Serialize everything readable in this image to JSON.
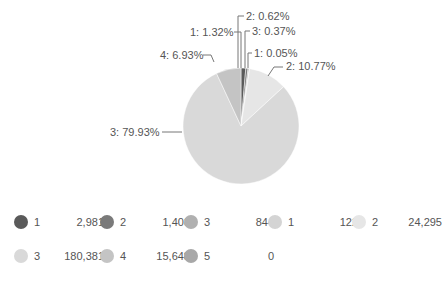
{
  "chart_data": {
    "type": "pie",
    "title": "",
    "start_angle": "12 o'clock, clockwise",
    "slices": [
      {
        "label": "1",
        "group": "A",
        "value": 2981,
        "percent": "1.32%",
        "color": "#5a5a5a"
      },
      {
        "label": "2",
        "group": "A",
        "value": 1408,
        "percent": "0.62%",
        "color": "#7a7a7a"
      },
      {
        "label": "3",
        "group": "A",
        "value": 844,
        "percent": "0.37%",
        "color": "#b0b0b0"
      },
      {
        "label": "1",
        "group": "B",
        "value": 122,
        "percent": "0.05%",
        "color": "#d4d4d4"
      },
      {
        "label": "2",
        "group": "B",
        "value": 24295,
        "percent": "10.77%",
        "color": "#e6e6e6"
      },
      {
        "label": "3",
        "group": "B",
        "value": 180381,
        "percent": "79.93%",
        "color": "#d9d9d9"
      },
      {
        "label": "4",
        "group": "B",
        "value": 15648,
        "percent": "6.93%",
        "color": "#c4c4c4"
      },
      {
        "label": "5",
        "group": "B",
        "value": 0,
        "percent": "0%",
        "color": "#a8a8a8"
      }
    ]
  },
  "slice_labels": [
    {
      "text": "1: 1.32%"
    },
    {
      "text": "2: 0.62%"
    },
    {
      "text": "3: 0.37%"
    },
    {
      "text": "1: 0.05%"
    },
    {
      "text": "2: 10.77%"
    },
    {
      "text": "3: 79.93%"
    },
    {
      "text": "4: 6.93%"
    }
  ],
  "legend": [
    {
      "name": "1",
      "value": "2,981",
      "color": "#5a5a5a"
    },
    {
      "name": "2",
      "value": "1,408",
      "color": "#7a7a7a"
    },
    {
      "name": "3",
      "value": "844",
      "color": "#b0b0b0"
    },
    {
      "name": "1",
      "value": "122",
      "color": "#d4d4d4"
    },
    {
      "name": "2",
      "value": "24,295",
      "color": "#e6e6e6"
    },
    {
      "name": "3",
      "value": "180,381",
      "color": "#d9d9d9"
    },
    {
      "name": "4",
      "value": "15,648",
      "color": "#c4c4c4"
    },
    {
      "name": "5",
      "value": "0",
      "color": "#a8a8a8"
    }
  ]
}
